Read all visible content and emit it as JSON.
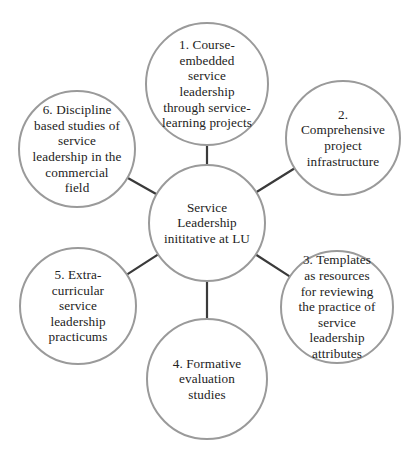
{
  "diagram": {
    "type": "hub-and-spoke",
    "center": {
      "id": "center",
      "lines": [
        "Service",
        "Leadership",
        "inititative at LU"
      ]
    },
    "nodes": [
      {
        "id": "node-1",
        "number": "1",
        "lines": [
          "1. Course-",
          "embedded",
          "service",
          "leadership",
          "through service-",
          "learning projects"
        ]
      },
      {
        "id": "node-2",
        "number": "2",
        "lines": [
          "2.",
          "Comprehensive",
          "project",
          "infrastructure"
        ]
      },
      {
        "id": "node-3",
        "number": "3",
        "lines": [
          "3. Templates",
          "as resources",
          "for reviewing",
          "the practice of",
          "service",
          "leadership",
          "attributes"
        ]
      },
      {
        "id": "node-4",
        "number": "4",
        "lines": [
          "4. Formative",
          "evaluation",
          "studies"
        ]
      },
      {
        "id": "node-5",
        "number": "5",
        "lines": [
          "5. Extra-",
          "curricular",
          "service",
          "leadership",
          "practicums"
        ]
      },
      {
        "id": "node-6",
        "number": "6",
        "lines": [
          "6. Discipline",
          "based studies of",
          "service",
          "leadership in the",
          "commercial",
          "field"
        ]
      }
    ],
    "edges": [
      {
        "from": "center",
        "to": "node-1"
      },
      {
        "from": "center",
        "to": "node-2"
      },
      {
        "from": "center",
        "to": "node-3"
      },
      {
        "from": "center",
        "to": "node-4"
      },
      {
        "from": "center",
        "to": "node-5"
      },
      {
        "from": "center",
        "to": "node-6"
      }
    ],
    "colors": {
      "circle_stroke": "#9a9a9a",
      "connector": "#3a3a3a",
      "text": "#222222",
      "background": "#ffffff"
    }
  }
}
